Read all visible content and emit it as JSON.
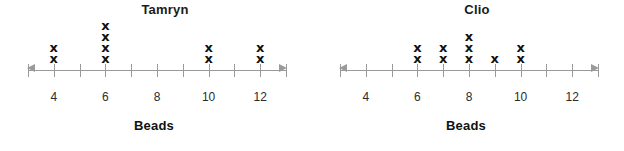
{
  "chart_data": [
    {
      "type": "scatter",
      "plot_style": "dot-plot",
      "title": "Tamryn",
      "xlabel": "Beads",
      "ylabel": "",
      "x_ticks": [
        3,
        4,
        5,
        6,
        7,
        8,
        9,
        10,
        11,
        12,
        13
      ],
      "x_tick_labels": [
        "",
        "4",
        "",
        "6",
        "",
        "8",
        "",
        "10",
        "",
        "12",
        ""
      ],
      "visible_tick_labels": [
        "4",
        "6",
        "8",
        "10",
        "12"
      ],
      "xlim": [
        3,
        13
      ],
      "grid": false,
      "legend": "none",
      "marker": "x",
      "categories": [
        4,
        5,
        6,
        7,
        8,
        9,
        10,
        11,
        12
      ],
      "values": [
        2,
        0,
        4,
        0,
        0,
        0,
        2,
        0,
        2
      ],
      "points": [
        {
          "x": 4,
          "count": 2
        },
        {
          "x": 6,
          "count": 4
        },
        {
          "x": 10,
          "count": 2
        },
        {
          "x": 12,
          "count": 2
        }
      ],
      "total_count": 10
    },
    {
      "type": "scatter",
      "plot_style": "dot-plot",
      "title": "Clio",
      "xlabel": "Beads",
      "ylabel": "",
      "x_ticks": [
        3,
        4,
        5,
        6,
        7,
        8,
        9,
        10,
        11,
        12,
        13
      ],
      "x_tick_labels": [
        "",
        "4",
        "",
        "6",
        "",
        "8",
        "",
        "10",
        "",
        "12",
        ""
      ],
      "visible_tick_labels": [
        "4",
        "6",
        "8",
        "10",
        "12"
      ],
      "xlim": [
        3,
        13
      ],
      "grid": false,
      "legend": "none",
      "marker": "x",
      "categories": [
        4,
        5,
        6,
        7,
        8,
        9,
        10,
        11,
        12
      ],
      "values": [
        0,
        0,
        2,
        2,
        3,
        1,
        2,
        0,
        0
      ],
      "points": [
        {
          "x": 6,
          "count": 2
        },
        {
          "x": 7,
          "count": 2
        },
        {
          "x": 8,
          "count": 3
        },
        {
          "x": 9,
          "count": 1
        },
        {
          "x": 10,
          "count": 2
        }
      ],
      "total_count": 10
    }
  ],
  "colors": {
    "background": "#ffffff",
    "axis": "#9a9a9a",
    "marker": "#111111",
    "title": "#1a1a1a",
    "tick_label": "#2b2b2b"
  },
  "marker_glyph": "x"
}
